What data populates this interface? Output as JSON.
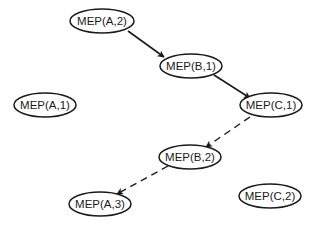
{
  "diagram": {
    "nodes": [
      {
        "id": "A2",
        "label": "MEP(A,2)",
        "cx": 102,
        "cy": 21,
        "rx": 32,
        "ry": 12
      },
      {
        "id": "B1",
        "label": "MEP(B,1)",
        "cx": 191,
        "cy": 66,
        "rx": 31,
        "ry": 12
      },
      {
        "id": "A1",
        "label": "MEP(A,1)",
        "cx": 45,
        "cy": 105,
        "rx": 31,
        "ry": 12
      },
      {
        "id": "C1",
        "label": "MEP(C,1)",
        "cx": 271,
        "cy": 105,
        "rx": 31,
        "ry": 12
      },
      {
        "id": "B2",
        "label": "MEP(B,2)",
        "cx": 190,
        "cy": 157,
        "rx": 31,
        "ry": 12
      },
      {
        "id": "A3",
        "label": "MEP(A,3)",
        "cx": 100,
        "cy": 204,
        "rx": 31,
        "ry": 12
      },
      {
        "id": "C2",
        "label": "MEP(C,2)",
        "cx": 270,
        "cy": 196,
        "rx": 31,
        "ry": 12
      }
    ],
    "edges": [
      {
        "from": "A2",
        "to": "B1",
        "style": "solid",
        "x1": 128,
        "y1": 31,
        "x2": 164,
        "y2": 57
      },
      {
        "from": "B1",
        "to": "C1",
        "style": "solid",
        "x1": 214,
        "y1": 75,
        "x2": 250,
        "y2": 98
      },
      {
        "from": "C1",
        "to": "B2",
        "style": "dashed",
        "x1": 250,
        "y1": 117,
        "x2": 206,
        "y2": 147
      },
      {
        "from": "B2",
        "to": "A3",
        "style": "dashed",
        "x1": 168,
        "y1": 166,
        "x2": 117,
        "y2": 194
      }
    ]
  }
}
